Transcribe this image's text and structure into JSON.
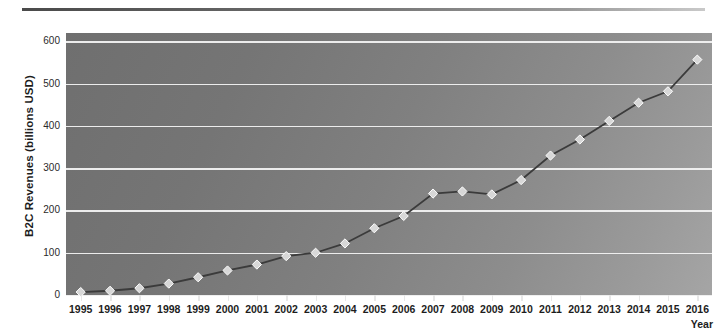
{
  "figure": {
    "divider": "top-rule",
    "background_color": "#ffffff"
  },
  "axis": {
    "y_title": "B2C Revenues (billions USD)",
    "x_title": "Year",
    "y_ticks": [
      "0",
      "100",
      "200",
      "300",
      "400",
      "500",
      "600"
    ],
    "x_ticks": [
      "1995",
      "1996",
      "1997",
      "1998",
      "1999",
      "2000",
      "2001",
      "2002",
      "2003",
      "2004",
      "2005",
      "2006",
      "2007",
      "2008",
      "2009",
      "2010",
      "2011",
      "2012",
      "2013",
      "2014",
      "2015",
      "2016"
    ]
  },
  "style": {
    "plot_fill_dark": "#6f6f6f",
    "plot_fill_light": "#a5a5a5",
    "gridline_color": "#f2f2f2",
    "series_line_color": "#3b3b3b",
    "marker_fill": "#d8d8d8",
    "marker_edge": "#ffffff"
  },
  "chart_data": {
    "type": "line",
    "title": "",
    "xlabel": "Year",
    "ylabel": "B2C Revenues (billions USD)",
    "xlim": [
      1995,
      2016
    ],
    "ylim": [
      0,
      620
    ],
    "yticks": [
      0,
      100,
      200,
      300,
      400,
      500,
      600
    ],
    "grid": true,
    "legend": false,
    "marker": "diamond",
    "x": [
      1995,
      1996,
      1997,
      1998,
      1999,
      2000,
      2001,
      2002,
      2003,
      2004,
      2005,
      2006,
      2007,
      2008,
      2009,
      2010,
      2011,
      2012,
      2013,
      2014,
      2015,
      2016
    ],
    "series": [
      {
        "name": "B2C Revenues",
        "values": [
          7,
          10,
          16,
          27,
          42,
          58,
          72,
          92,
          100,
          122,
          158,
          187,
          240,
          245,
          238,
          272,
          330,
          368,
          412,
          455,
          482,
          557
        ]
      }
    ]
  }
}
